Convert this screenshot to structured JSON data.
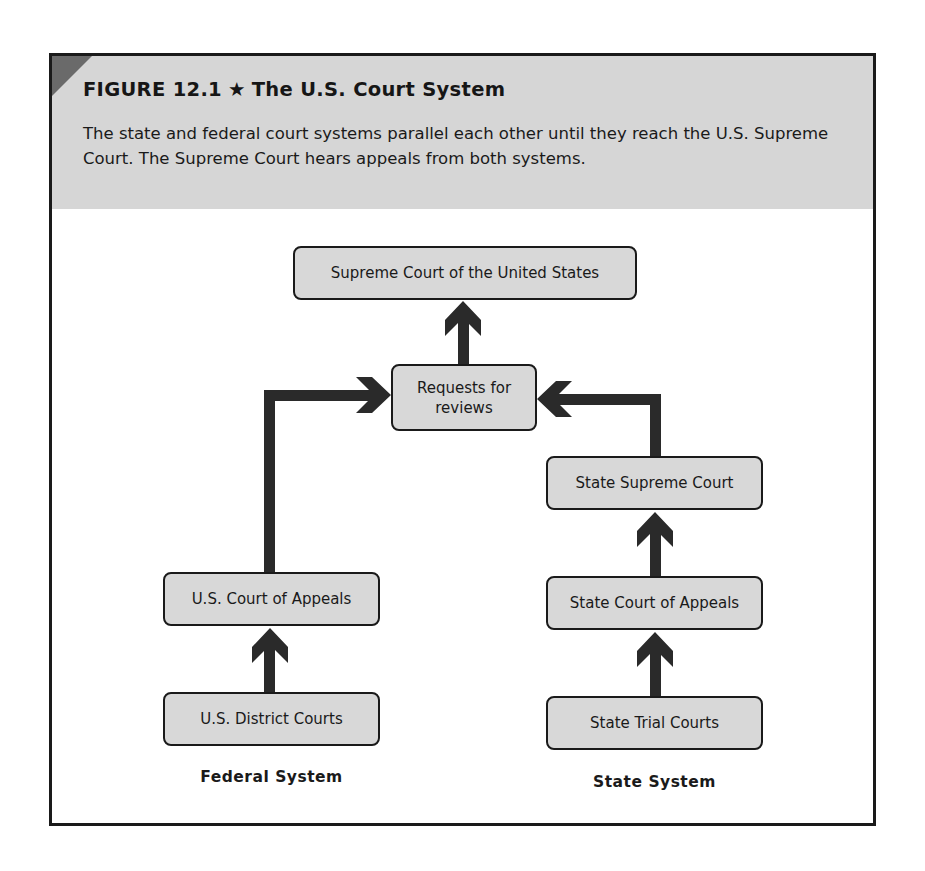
{
  "figure": {
    "number_label": "FIGURE 12.1",
    "star_icon": "★",
    "title": "The U.S. Court System",
    "caption": "The state and federal court systems parallel each other until they reach the U.S. Supreme Court. The Supreme Court hears appeals from both systems."
  },
  "diagram": {
    "top": {
      "supreme_court": "Supreme Court of the United States",
      "requests_line1": "Requests for",
      "requests_line2": "reviews"
    },
    "federal": {
      "label": "Federal System",
      "appeals": "U.S. Court of Appeals",
      "district": "U.S. District Courts"
    },
    "state": {
      "label": "State System",
      "supreme": "State Supreme Court",
      "appeals": "State Court of Appeals",
      "trial": "State Trial Courts"
    }
  },
  "colors": {
    "header_band": "#d6d6d6",
    "node_fill": "#d8d8d8",
    "arrow": "#2a2a2a",
    "frame": "#1a1a1a",
    "corner_tab": "#6a6a6a"
  }
}
